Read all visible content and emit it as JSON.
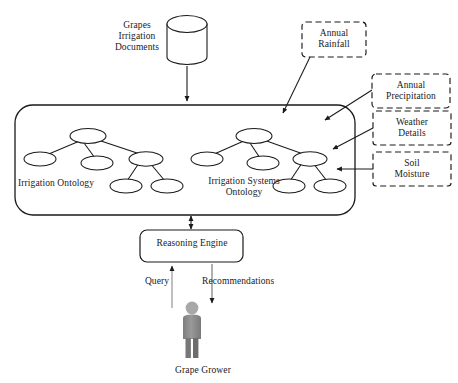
{
  "diagram": {
    "source": {
      "label": "Grapes\nIrrigation\nDocuments",
      "icon": "database-cylinder-icon"
    },
    "container": {
      "name": "ontology-container",
      "ontologies": [
        {
          "id": "irrigation-ontology",
          "label": "Irrigation Ontology",
          "nodes": 6,
          "shape": "tree-of-ellipses"
        },
        {
          "id": "irrigation-systems-ontology",
          "label": "Irrigation Systems\nOntology",
          "nodes": 6,
          "shape": "tree-of-ellipses"
        }
      ]
    },
    "external_inputs": [
      {
        "id": "annual-rainfall",
        "label": "Annual\nRainfall"
      },
      {
        "id": "annual-precipitation",
        "label": "Annual\nPrecipitation"
      },
      {
        "id": "weather-details",
        "label": "Weather\nDetails"
      },
      {
        "id": "soil-moisture",
        "label": "Soil\nMoisture"
      }
    ],
    "engine": {
      "id": "reasoning-engine",
      "label": "Reasoning Engine"
    },
    "flows": [
      {
        "id": "query-flow",
        "label": "Query",
        "direction": "up"
      },
      {
        "id": "recommendations-flow",
        "label": "Recommendations",
        "direction": "down"
      }
    ],
    "actor": {
      "id": "grape-grower",
      "label": "Grape Grower",
      "icon": "person-icon"
    },
    "colors": {
      "stroke": "#1a1a1a",
      "fill": "#ffffff",
      "actor_body": "#8c8c8c",
      "actor_head": "#a6a6a6",
      "background": "#ffffff"
    }
  }
}
